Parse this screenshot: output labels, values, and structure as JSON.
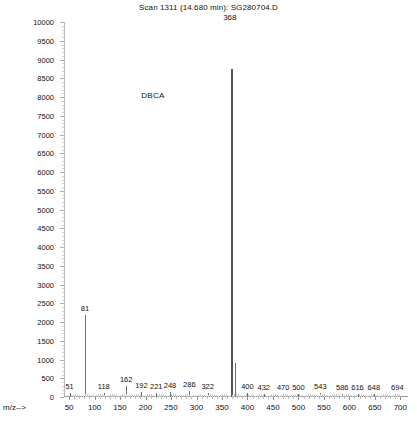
{
  "header": {
    "title": "Scan 1311 (14.680 min): SG280704.D",
    "base_peak_label": "368",
    "compound_label": "DBCA"
  },
  "axes": {
    "x_axis_title": "m/z-->",
    "y_axis_title": "",
    "x_tick_labels": [
      "50",
      "100",
      "150",
      "200",
      "250",
      "300",
      "350",
      "400",
      "450",
      "500",
      "550",
      "600",
      "650",
      "700"
    ],
    "y_tick_labels": [
      "0",
      "500",
      "1000",
      "1500",
      "2000",
      "2500",
      "3000",
      "3500",
      "4000",
      "4500",
      "5000",
      "5500",
      "6000",
      "6500",
      "7000",
      "7500",
      "8000",
      "8500",
      "9000",
      "9500",
      "10000"
    ]
  },
  "chart_data": {
    "type": "bar",
    "title": "Scan 1311 (14.680 min): SG280704.D",
    "xlabel": "m/z-->",
    "ylabel": "Abundance",
    "xlim": [
      40,
      715
    ],
    "ylim": [
      0,
      10000
    ],
    "grid": false,
    "legend": "none",
    "annotations": [
      {
        "text": "DBCA",
        "x": 215,
        "y": 8000
      },
      {
        "text": "368",
        "x": 368,
        "y": 9400
      }
    ],
    "x": [
      51,
      81,
      118,
      162,
      192,
      221,
      248,
      286,
      322,
      368,
      375,
      400,
      432,
      470,
      500,
      543,
      586,
      616,
      648,
      694
    ],
    "values": [
      120,
      2200,
      120,
      300,
      130,
      120,
      140,
      150,
      110,
      8750,
      900,
      120,
      90,
      90,
      80,
      110,
      80,
      80,
      80,
      80
    ],
    "labeled_peaks": [
      {
        "mz": 51,
        "label": "51"
      },
      {
        "mz": 81,
        "label": "81"
      },
      {
        "mz": 118,
        "label": "118"
      },
      {
        "mz": 162,
        "label": "162"
      },
      {
        "mz": 192,
        "label": "192"
      },
      {
        "mz": 221,
        "label": "221"
      },
      {
        "mz": 248,
        "label": "248"
      },
      {
        "mz": 286,
        "label": "286"
      },
      {
        "mz": 322,
        "label": "322"
      },
      {
        "mz": 368,
        "label": "368"
      },
      {
        "mz": 400,
        "label": "400"
      },
      {
        "mz": 432,
        "label": "432"
      },
      {
        "mz": 470,
        "label": "470"
      },
      {
        "mz": 500,
        "label": "500"
      },
      {
        "mz": 543,
        "label": "543"
      },
      {
        "mz": 586,
        "label": "586"
      },
      {
        "mz": 616,
        "label": "616"
      },
      {
        "mz": 648,
        "label": "648"
      },
      {
        "mz": 694,
        "label": "694"
      }
    ]
  },
  "style": {
    "peak_color": "#6e6e6e",
    "axis_color": "#9a9a9a",
    "text_color": "#111111",
    "background": "#ffffff"
  }
}
